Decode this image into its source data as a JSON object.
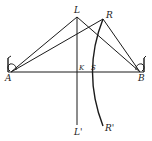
{
  "diagram": {
    "type": "geometric-construction",
    "points": {
      "L": {
        "label": "L",
        "x": 77,
        "y": 17
      },
      "R": {
        "label": "R",
        "x": 103,
        "y": 19
      },
      "A": {
        "label": "A",
        "x": 11,
        "y": 72
      },
      "B": {
        "label": "B",
        "x": 140,
        "y": 72
      },
      "K": {
        "label": "K",
        "x": 77,
        "y": 72
      },
      "S": {
        "label": "S",
        "x": 89,
        "y": 72
      },
      "L_prime": {
        "label": "L'",
        "x": 77,
        "y": 125
      },
      "R_prime": {
        "label": "R'",
        "x": 103,
        "y": 126
      }
    },
    "segments": [
      "A-L",
      "A-R",
      "L-B",
      "R-B",
      "A-B",
      "L-L'"
    ],
    "curves": [
      "R-S-R' arc"
    ],
    "instruments": [
      {
        "at": "A",
        "label": "transit-A"
      },
      {
        "at": "B",
        "label": "transit-B"
      }
    ]
  },
  "labels": {
    "L": "L",
    "R": "R",
    "A": "A",
    "B": "B",
    "K": "K",
    "S": "S",
    "L_prime": "L'",
    "R_prime": "R'"
  },
  "colors": {
    "ink": "#1a1a1a",
    "background": "#ffffff"
  }
}
